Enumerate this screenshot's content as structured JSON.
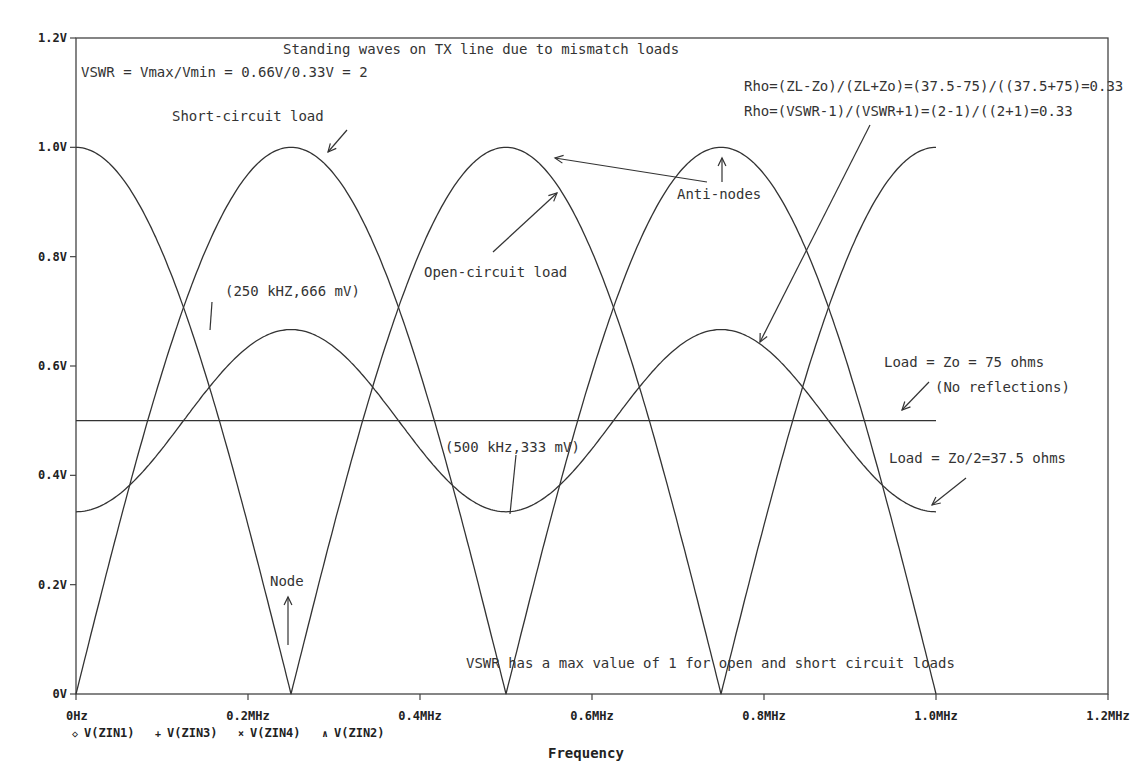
{
  "chart_data": {
    "type": "line",
    "title": "Standing waves on TX line due to mismatch loads",
    "xlabel": "Frequency",
    "ylabel": "",
    "xlim": [
      0,
      1.2
    ],
    "ylim": [
      0,
      1.2
    ],
    "x_unit": "MHz",
    "grid": false,
    "x_ticks": [
      "0Hz",
      "0.2MHz",
      "0.4MHz",
      "0.6MHz",
      "0.8MHz",
      "1.0MHz",
      "1.2MHz"
    ],
    "y_ticks": [
      "0V",
      "0.2V",
      "0.4V",
      "0.6V",
      "0.8V",
      "1.0V",
      "1.2V"
    ],
    "x": [
      0,
      0.125,
      0.25,
      0.375,
      0.5,
      0.625,
      0.75,
      0.875,
      1.0
    ],
    "series": [
      {
        "name": "V(ZIN1)",
        "marker": "diamond",
        "description": "Short-circuit load",
        "values": [
          1.0,
          0.707,
          0.0,
          0.707,
          1.0,
          0.707,
          0.0,
          0.707,
          1.0
        ]
      },
      {
        "name": "V(ZIN3)",
        "marker": "plus",
        "description": "Open-circuit load",
        "values": [
          0.0,
          0.707,
          1.0,
          0.707,
          0.0,
          0.707,
          1.0,
          0.707,
          0.0
        ]
      },
      {
        "name": "V(ZIN4)",
        "marker": "x",
        "description": "Load = Zo = 75 ohms (No reflections)",
        "values": [
          0.5,
          0.5,
          0.5,
          0.5,
          0.5,
          0.5,
          0.5,
          0.5,
          0.5
        ]
      },
      {
        "name": "V(ZIN2)",
        "marker": "triangle",
        "description": "Load = Zo/2=37.5 ohms",
        "values": [
          0.333,
          0.5,
          0.666,
          0.5,
          0.333,
          0.5,
          0.666,
          0.5,
          0.333
        ]
      }
    ],
    "legend_position": "bottom-left",
    "annotations": [
      "VSWR = Vmax/Vmin = 0.66V/0.33V = 2",
      "Rho=(ZL-Zo)/(ZL+Zo)=(37.5-75)/((37.5+75)=0.33",
      "Rho=(VSWR-1)/(VSWR+1)=(2-1)/((2+1)=0.33",
      "Short-circuit load",
      "Anti-nodes",
      "Open-circuit load",
      "(250 kHZ,666 mV)",
      "Load = Zo = 75 ohms",
      "(No reflections)",
      "(500 kHz,333 mV)",
      "Load = Zo/2=37.5 ohms",
      "Node",
      "VSWR has a max value of 1 for open and short circuit loads"
    ]
  },
  "labels": {
    "title": "Standing waves on TX line due to mismatch loads",
    "vswr": "VSWR = Vmax/Vmin = 0.66V/0.33V = 2",
    "rho1": "Rho=(ZL-Zo)/(ZL+Zo)=(37.5-75)/((37.5+75)=0.33",
    "rho2": "Rho=(VSWR-1)/(VSWR+1)=(2-1)/((2+1)=0.33",
    "short_circuit": "Short-circuit load",
    "anti_nodes": "Anti-nodes",
    "open_circuit": "Open-circuit load",
    "peak_point": "(250 kHZ,666 mV)",
    "matched_load": "Load = Zo = 75 ohms",
    "no_reflections": "(No reflections)",
    "min_point": "(500 kHz,333 mV)",
    "half_load": "Load = Zo/2=37.5 ohms",
    "node": "Node",
    "vswr_note": "VSWR has a max value of 1 for open and short circuit loads",
    "xlabel": "Frequency"
  },
  "legend": [
    {
      "symbol": "◇",
      "label": "V(ZIN1)"
    },
    {
      "symbol": "+",
      "label": "V(ZIN3)"
    },
    {
      "symbol": "×",
      "label": "V(ZIN4)"
    },
    {
      "symbol": "∧",
      "label": "V(ZIN2)"
    }
  ],
  "colors": {
    "line": "#333333",
    "axis": "#444444",
    "background": "#ffffff"
  }
}
